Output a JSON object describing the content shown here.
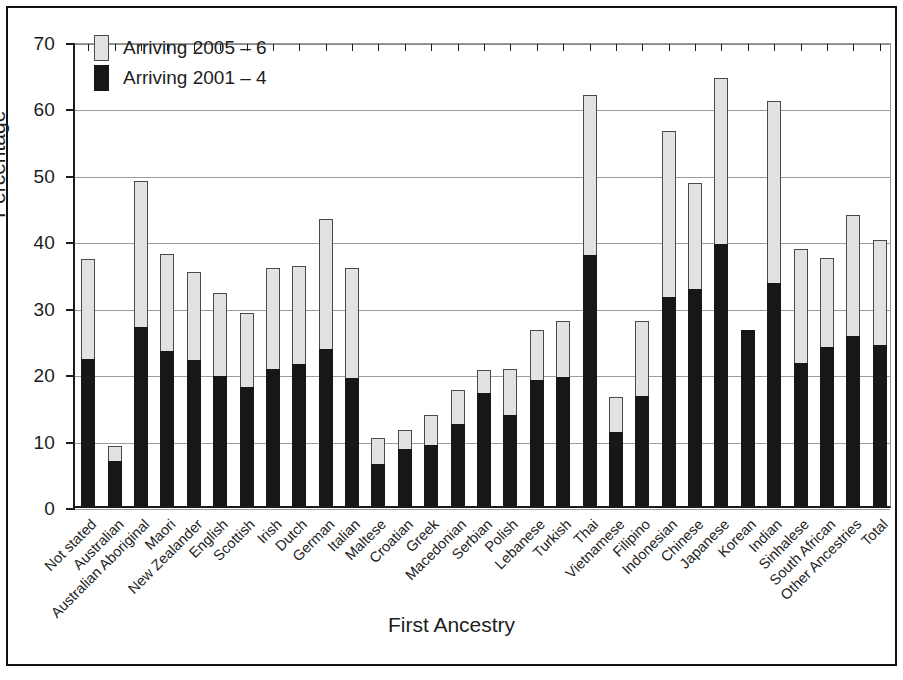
{
  "chart_data": {
    "type": "bar",
    "subtype": "stacked",
    "title": "",
    "xlabel": "First Ancestry",
    "ylabel": "Percentage",
    "ylim": [
      0,
      70
    ],
    "yticks": [
      0,
      10,
      20,
      30,
      40,
      50,
      60,
      70
    ],
    "grid": true,
    "legend_position": "top-left",
    "categories": [
      "Not stated",
      "Australian",
      "Australian Aboriginal",
      "Maori",
      "New Zealander",
      "English",
      "Scottish",
      "Irish",
      "Dutch",
      "German",
      "Italian",
      "Maltese",
      "Croatian",
      "Greek",
      "Macedonian",
      "Serbian",
      "Polish",
      "Lebanese",
      "Turkish",
      "Thai",
      "Vietnamese",
      "Filipino",
      "Indonesian",
      "Chinese",
      "Japanese",
      "Korean",
      "Indian",
      "Sinhalese",
      "South African",
      "Other Ancestries",
      "Total"
    ],
    "series": [
      {
        "name": "Arriving 2001 – 4",
        "color": "#171717",
        "values": [
          22.2,
          6.8,
          26.9,
          23.3,
          22.0,
          19.5,
          17.9,
          20.7,
          21.4,
          23.7,
          19.2,
          6.3,
          8.6,
          9.2,
          12.3,
          17.0,
          13.7,
          18.9,
          19.4,
          37.8,
          11.1,
          16.5,
          31.5,
          32.6,
          39.4,
          26.5,
          33.5,
          21.5,
          23.9,
          25.6,
          24.3
        ]
      },
      {
        "name": "Arriving 2005 – 6",
        "color": "#e2e2e2",
        "values": [
          15.0,
          2.2,
          22.1,
          14.7,
          13.3,
          12.5,
          11.2,
          15.1,
          14.8,
          19.5,
          16.6,
          4.0,
          2.8,
          4.5,
          5.1,
          3.5,
          6.9,
          7.6,
          8.4,
          24.1,
          5.3,
          11.4,
          24.9,
          16.0,
          25.1,
          0.0,
          27.5,
          17.2,
          13.5,
          18.2,
          15.8
        ]
      }
    ],
    "totals": [
      37.2,
      9.0,
      49.0,
      38.0,
      35.3,
      32.0,
      29.1,
      35.8,
      36.2,
      43.2,
      35.8,
      10.3,
      11.4,
      13.7,
      17.4,
      20.5,
      20.6,
      26.5,
      27.8,
      61.9,
      16.4,
      27.9,
      56.4,
      48.6,
      64.5,
      26.5,
      61.0,
      38.7,
      37.4,
      43.8,
      40.1
    ]
  },
  "legend": {
    "entries": [
      {
        "label": "Arriving 2005 – 6",
        "swatch": "light"
      },
      {
        "label": "Arriving 2001 – 4",
        "swatch": "dark"
      }
    ]
  }
}
